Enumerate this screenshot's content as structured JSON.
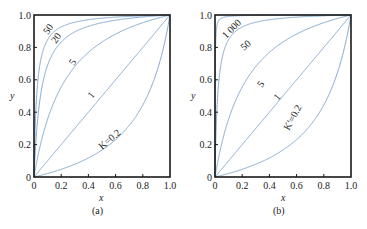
{
  "chart_data": [
    {
      "type": "line",
      "panel": "(a)",
      "title": "",
      "xlabel": "x",
      "ylabel": "y",
      "xlim": [
        0,
        1.0
      ],
      "ylim": [
        0,
        1.0
      ],
      "xticks": [
        "0",
        "0.2",
        "0.4",
        "0.6",
        "0.8",
        "1.0"
      ],
      "yticks": [
        "0",
        "0.2",
        "0.4",
        "0.6",
        "0.8",
        "1.0"
      ],
      "grid": false,
      "formula": "y = Kx / (1 + (K - 1)x)",
      "series": [
        {
          "name": "50",
          "param": 50
        },
        {
          "name": "20",
          "param": 20
        },
        {
          "name": "5",
          "param": 5
        },
        {
          "name": "1",
          "param": 1
        },
        {
          "name": "K=0.2",
          "param": 0.2
        }
      ]
    },
    {
      "type": "line",
      "panel": "(b)",
      "title": "",
      "xlabel": "x",
      "ylabel": "y",
      "xlim": [
        0,
        1.0
      ],
      "ylim": [
        0,
        1.0
      ],
      "xticks": [
        "0",
        "0.2",
        "0.4",
        "0.6",
        "0.8",
        "1.0"
      ],
      "yticks": [
        "0",
        "0.2",
        "0.4",
        "0.6",
        "0.8",
        "1.0"
      ],
      "grid": false,
      "formula": "y = K'x / (1 + (K' - 1)x)",
      "series": [
        {
          "name": "1 000",
          "param": 1000
        },
        {
          "name": "50",
          "param": 50
        },
        {
          "name": "5",
          "param": 5
        },
        {
          "name": "1",
          "param": 1
        },
        {
          "name": "K'=0.2",
          "param": 0.2
        }
      ]
    }
  ],
  "panels": [
    {
      "label": "(a)",
      "xlabel": "x",
      "ylabel": "y",
      "xticks": [
        "0",
        "0.2",
        "0.4",
        "0.6",
        "0.8",
        "1.0"
      ],
      "yticks": [
        "0",
        "0.2",
        "0.4",
        "0.6",
        "0.8",
        "1.0"
      ],
      "curve_labels": [
        "50",
        "20",
        "5",
        "1",
        "K=0.2"
      ]
    },
    {
      "label": "(b)",
      "xlabel": "x",
      "ylabel": "y",
      "xticks": [
        "0",
        "0.2",
        "0.4",
        "0.6",
        "0.8",
        "1.0"
      ],
      "yticks": [
        "0",
        "0.2",
        "0.4",
        "0.6",
        "0.8",
        "1.0"
      ],
      "curve_labels": [
        "1 000",
        "50",
        "5",
        "1",
        "K'=0.2"
      ]
    }
  ],
  "colors": {
    "curve": "#7fa6cf",
    "frame": "#1a1a1a"
  }
}
